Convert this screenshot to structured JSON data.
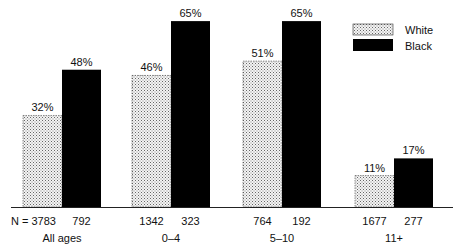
{
  "chart_data": {
    "type": "bar",
    "title": "",
    "xlabel": "",
    "ylabel": "",
    "ylim": [
      0,
      70
    ],
    "grid": false,
    "legend_position": "top-right",
    "categories": [
      "All ages",
      "0–4",
      "5–10",
      "11+"
    ],
    "series": [
      {
        "name": "White",
        "values": [
          32,
          46,
          51,
          11
        ],
        "labels": [
          "32%",
          "46%",
          "51%",
          "11%"
        ],
        "n": [
          3783,
          1342,
          764,
          1677
        ],
        "fill": "dotted-light"
      },
      {
        "name": "Black",
        "values": [
          48,
          65,
          65,
          17
        ],
        "labels": [
          "48%",
          "65%",
          "65%",
          "17%"
        ],
        "n": [
          792,
          323,
          192,
          277
        ],
        "fill": "#000000"
      }
    ],
    "n_prefix": "N = "
  },
  "legend": {
    "items": [
      {
        "label": "White"
      },
      {
        "label": "Black"
      }
    ]
  },
  "colors": {
    "black_bar": "#000000",
    "white_bar_dots": "#555555",
    "axis": "#222222"
  }
}
